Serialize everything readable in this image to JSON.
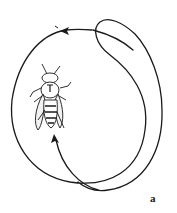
{
  "figure": {
    "type": "round-dance-path",
    "panel_label": "a",
    "colors": {
      "stroke": "#1a1a1a",
      "background": "#ffffff"
    },
    "arrows": [
      {
        "name": "top-arrow",
        "direction": "left"
      },
      {
        "name": "bottom-arrow",
        "direction": "up"
      }
    ]
  }
}
